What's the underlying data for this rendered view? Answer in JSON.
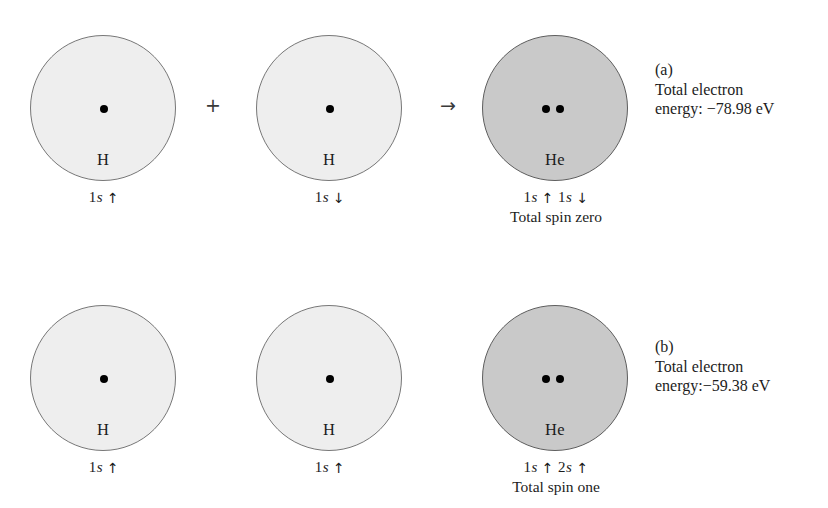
{
  "figure": {
    "rows": [
      {
        "id": "row-a",
        "reactants": [
          {
            "element": "H",
            "shell": "light",
            "electrons": 1,
            "config_n": "1",
            "config_orbital": "s",
            "spin_arrow": "↑",
            "config_text": "1s ↑"
          },
          {
            "element": "H",
            "shell": "light",
            "electrons": 1,
            "config_n": "1",
            "config_orbital": "s",
            "spin_arrow": "↓",
            "config_text": "1s ↓"
          }
        ],
        "product": {
          "element": "He",
          "shell": "dark",
          "electrons": 2,
          "config_text": "1s ↑ 1s ↓",
          "config_parts": [
            {
              "n": "1",
              "orbital": "s",
              "arrow": "↑"
            },
            {
              "n": "1",
              "orbital": "s",
              "arrow": "↓"
            }
          ],
          "spin_text": "Total spin zero"
        },
        "operators": {
          "plus": "+",
          "yields": "→"
        },
        "annotation": {
          "tag": "(a)",
          "line1": "Total electron",
          "line2": "energy: −78.98 eV",
          "energy_value": -78.98,
          "energy_unit": "eV"
        }
      },
      {
        "id": "row-b",
        "reactants": [
          {
            "element": "H",
            "shell": "light",
            "electrons": 1,
            "config_n": "1",
            "config_orbital": "s",
            "spin_arrow": "↑",
            "config_text": "1s ↑"
          },
          {
            "element": "H",
            "shell": "light",
            "electrons": 1,
            "config_n": "1",
            "config_orbital": "s",
            "spin_arrow": "↑",
            "config_text": "1s ↑"
          }
        ],
        "product": {
          "element": "He",
          "shell": "dark",
          "electrons": 2,
          "config_text": "1s ↑ 2s ↑",
          "config_parts": [
            {
              "n": "1",
              "orbital": "s",
              "arrow": "↑"
            },
            {
              "n": "2",
              "orbital": "s",
              "arrow": "↑"
            }
          ],
          "spin_text": "Total spin one"
        },
        "operators": {
          "plus": "",
          "yields": ""
        },
        "annotation": {
          "tag": "(b)",
          "line1": "Total electron",
          "line2": "energy:−59.38 eV",
          "energy_value": -59.38,
          "energy_unit": "eV"
        }
      }
    ],
    "colors": {
      "background": "#ffffff",
      "hydrogen_fill": "#eeeeee",
      "helium_fill": "#c9c9c9",
      "outline": "#6b6b6b",
      "dot": "#000000",
      "text": "#1c1c1c"
    }
  }
}
